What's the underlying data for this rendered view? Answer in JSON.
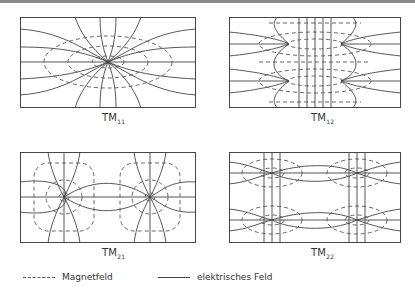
{
  "figure": {
    "panels": [
      {
        "id": "tm11",
        "mode": "TM",
        "index": "11"
      },
      {
        "id": "tm12",
        "mode": "TM",
        "index": "12"
      },
      {
        "id": "tm21",
        "mode": "TM",
        "index": "21"
      },
      {
        "id": "tm22",
        "mode": "TM",
        "index": "22"
      }
    ]
  },
  "legend": {
    "magnetic": "Magnetfeld",
    "electric": "elektrisches Feld"
  },
  "colors": {
    "line": "#444444",
    "dashed": "#555555",
    "border": "#333333"
  }
}
